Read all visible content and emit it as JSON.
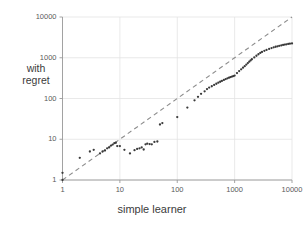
{
  "chart_data": {
    "type": "scatter",
    "title": "",
    "xlabel": "simple learner",
    "ylabel": "with regret",
    "xscale": "log",
    "yscale": "log",
    "xlim": [
      1,
      10000
    ],
    "ylim": [
      1,
      10000
    ],
    "xticks": [
      "1",
      "10",
      "100",
      "1000",
      "10000"
    ],
    "yticks": [
      "1",
      "10",
      "100",
      "1000",
      "10000"
    ],
    "xtick_values": [
      1,
      10,
      100,
      1000,
      10000
    ],
    "ytick_values": [
      1,
      10,
      100,
      1000,
      10000
    ],
    "grid": true,
    "legend": "none",
    "point_color": "#3a3a3a",
    "grid_color": "#e3e3e3",
    "axis_color": "#9a9a9a",
    "reference_line": {
      "name": "y = x diagonal",
      "style": "dashed",
      "color": "#8d8d8d",
      "x": [
        1,
        10000
      ],
      "y": [
        1,
        10000
      ]
    },
    "series": [
      {
        "name": "with regret vs simple learner",
        "marker": "dot",
        "points": [
          [
            1,
            1.0
          ],
          [
            1,
            1.5
          ],
          [
            2,
            3.5
          ],
          [
            3,
            5.0
          ],
          [
            3.5,
            5.5
          ],
          [
            4.5,
            4.5
          ],
          [
            5,
            5.0
          ],
          [
            5.5,
            5.3
          ],
          [
            6,
            6.0
          ],
          [
            6.5,
            6.3
          ],
          [
            7,
            7.0
          ],
          [
            7.5,
            7.4
          ],
          [
            8,
            8.0
          ],
          [
            8.5,
            8.2
          ],
          [
            9,
            6.8
          ],
          [
            10,
            6.8
          ],
          [
            12,
            5.5
          ],
          [
            15,
            4.5
          ],
          [
            18,
            5.4
          ],
          [
            20,
            5.8
          ],
          [
            22,
            6.0
          ],
          [
            24,
            6.3
          ],
          [
            26,
            5.6
          ],
          [
            28,
            7.5
          ],
          [
            30,
            7.8
          ],
          [
            33,
            7.6
          ],
          [
            36,
            7.5
          ],
          [
            40,
            8.6
          ],
          [
            45,
            8.8
          ],
          [
            50,
            23
          ],
          [
            55,
            25
          ],
          [
            100,
            35
          ],
          [
            150,
            60
          ],
          [
            200,
            90
          ],
          [
            230,
            110
          ],
          [
            260,
            130
          ],
          [
            300,
            150
          ],
          [
            330,
            170
          ],
          [
            360,
            185
          ],
          [
            400,
            200
          ],
          [
            440,
            215
          ],
          [
            480,
            230
          ],
          [
            520,
            245
          ],
          [
            560,
            258
          ],
          [
            600,
            270
          ],
          [
            650,
            285
          ],
          [
            700,
            300
          ],
          [
            750,
            312
          ],
          [
            800,
            325
          ],
          [
            850,
            335
          ],
          [
            900,
            345
          ],
          [
            950,
            355
          ],
          [
            1000,
            365
          ],
          [
            1100,
            420
          ],
          [
            1200,
            470
          ],
          [
            1300,
            520
          ],
          [
            1400,
            570
          ],
          [
            1500,
            620
          ],
          [
            1600,
            680
          ],
          [
            1700,
            740
          ],
          [
            1800,
            800
          ],
          [
            1900,
            860
          ],
          [
            2000,
            920
          ],
          [
            2200,
            1020
          ],
          [
            2400,
            1120
          ],
          [
            2600,
            1220
          ],
          [
            2800,
            1310
          ],
          [
            3000,
            1390
          ],
          [
            3300,
            1480
          ],
          [
            3600,
            1560
          ],
          [
            4000,
            1650
          ],
          [
            4400,
            1730
          ],
          [
            4800,
            1800
          ],
          [
            5200,
            1860
          ],
          [
            5600,
            1910
          ],
          [
            6000,
            1960
          ],
          [
            6500,
            2010
          ],
          [
            7000,
            2060
          ],
          [
            7500,
            2100
          ],
          [
            8000,
            2140
          ],
          [
            8600,
            2180
          ],
          [
            9200,
            2210
          ],
          [
            10000,
            2250
          ]
        ]
      }
    ]
  }
}
